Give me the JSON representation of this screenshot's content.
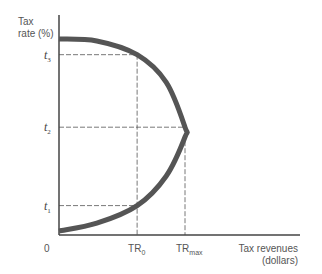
{
  "chart_data": {
    "type": "line",
    "title": "",
    "xlabel": "Tax revenues (dollars)",
    "xlabel_lines": [
      "Tax revenues",
      "(dollars)"
    ],
    "ylabel": "Tax rate (%)",
    "ylabel_lines": [
      "Tax",
      "rate (%)"
    ],
    "origin_label": "0",
    "grid": false,
    "legend": "none",
    "xlim": [
      0,
      1.7
    ],
    "ylim": [
      0,
      1.1
    ],
    "series": [
      {
        "name": "Laffer curve",
        "color": "#555555",
        "points": [
          {
            "x": 0.0,
            "y": 0.02
          },
          {
            "x": 0.3,
            "y": 0.06
          },
          {
            "x": 0.62,
            "y": 0.15
          },
          {
            "x": 0.85,
            "y": 0.3
          },
          {
            "x": 1.0,
            "y": 0.5
          },
          {
            "x": 1.0,
            "y": 0.55
          },
          {
            "x": 0.85,
            "y": 0.78
          },
          {
            "x": 0.62,
            "y": 0.92
          },
          {
            "x": 0.3,
            "y": 0.99
          },
          {
            "x": 0.0,
            "y": 1.0
          }
        ]
      }
    ],
    "y_ticks": [
      {
        "label": "t",
        "sub": "1",
        "value": 0.15
      },
      {
        "label": "t",
        "sub": "2",
        "value": 0.55
      },
      {
        "label": "t",
        "sub": "3",
        "value": 0.92
      }
    ],
    "x_ticks": [
      {
        "label": "TR",
        "sub": "0",
        "value": 0.62
      },
      {
        "label": "TR",
        "sub": "max",
        "value": 1.0
      }
    ],
    "reference_lines": [
      {
        "from_tick": "t1",
        "to_tick": "TR0",
        "style": "dashed"
      },
      {
        "from_tick": "t3",
        "to_tick": "TR0",
        "style": "dashed"
      },
      {
        "from_tick": "t2",
        "to_tick": "TRmax",
        "style": "dashed"
      }
    ]
  }
}
